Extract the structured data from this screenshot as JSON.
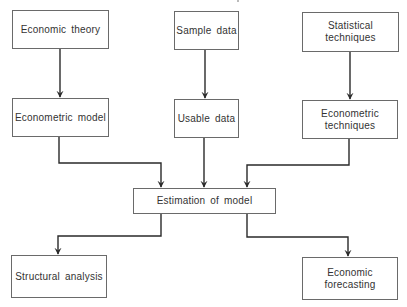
{
  "diagram": {
    "type": "flowchart",
    "nodes": {
      "economic_theory": {
        "label": "Economic theory"
      },
      "sample_data": {
        "label": "Sample data"
      },
      "statistical_techniques": {
        "label": "Statistical\ntechniques"
      },
      "econometric_model": {
        "label": "Econometric model"
      },
      "usable_data": {
        "label": "Usable data"
      },
      "econometric_techniques": {
        "label": "Econometric\ntechniques"
      },
      "estimation_of_model": {
        "label": "Estimation of model"
      },
      "structural_analysis": {
        "label": "Structural analysis"
      },
      "economic_forecasting": {
        "label": "Economic forecasting"
      }
    },
    "edges": [
      {
        "from": "Economic theory",
        "to": "Econometric model"
      },
      {
        "from": "Sample data",
        "to": "Usable data"
      },
      {
        "from": "Statistical techniques",
        "to": "Econometric techniques"
      },
      {
        "from": "Econometric model",
        "to": "Estimation of model"
      },
      {
        "from": "Usable data",
        "to": "Estimation of model"
      },
      {
        "from": "Econometric techniques",
        "to": "Estimation of model"
      },
      {
        "from": "Estimation of model",
        "to": "Structural analysis"
      },
      {
        "from": "Estimation of model",
        "to": "Economic forecasting"
      }
    ],
    "colors": {
      "line": "#2a2a2a",
      "border": "#6a6a6a",
      "text": "#333333",
      "background": "#ffffff"
    }
  }
}
